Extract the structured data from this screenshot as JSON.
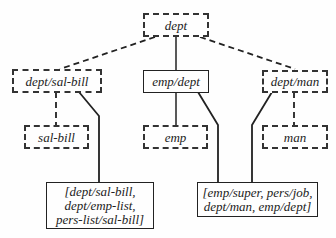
{
  "diagram": {
    "nodes": [
      {
        "id": "dept",
        "label": "dept",
        "style": "dashed"
      },
      {
        "id": "dept_sal_bill",
        "label": "dept/sal-bill",
        "style": "dashed"
      },
      {
        "id": "emp_dept",
        "label": "emp/dept",
        "style": "solid"
      },
      {
        "id": "dept_man",
        "label": "dept/man",
        "style": "dashed"
      },
      {
        "id": "sal_bill",
        "label": "sal-bill",
        "style": "dashed"
      },
      {
        "id": "emp",
        "label": "emp",
        "style": "dashed"
      },
      {
        "id": "man",
        "label": "man",
        "style": "dashed"
      },
      {
        "id": "list_left",
        "lines": [
          "[dept/sal-bill,",
          "dept/emp-list,",
          "pers-list/sal-bill]"
        ],
        "style": "solid"
      },
      {
        "id": "list_right",
        "lines": [
          "[emp/super, pers/job,",
          "dept/man, emp/dept]"
        ],
        "style": "solid"
      }
    ],
    "edges": [
      {
        "from": "dept",
        "to": "dept_sal_bill",
        "style": "dashed"
      },
      {
        "from": "dept",
        "to": "emp_dept",
        "style": "solid"
      },
      {
        "from": "dept",
        "to": "dept_man",
        "style": "dashed"
      },
      {
        "from": "dept_sal_bill",
        "to": "sal_bill",
        "style": "dashed"
      },
      {
        "from": "dept_sal_bill",
        "to": "list_left",
        "style": "solid"
      },
      {
        "from": "emp_dept",
        "to": "emp",
        "style": "solid"
      },
      {
        "from": "emp_dept",
        "to": "list_right",
        "style": "solid"
      },
      {
        "from": "dept_man",
        "to": "man",
        "style": "dashed"
      },
      {
        "from": "dept_man",
        "to": "list_right",
        "style": "solid"
      }
    ]
  }
}
